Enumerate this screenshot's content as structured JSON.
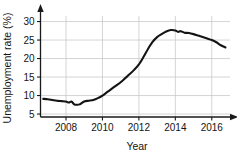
{
  "chart_data": {
    "type": "line",
    "title": "",
    "xlabel": "Year",
    "ylabel": "Unemployment rate (%)",
    "xlim": [
      2006.6,
      2017.0
    ],
    "ylim": [
      4.2,
      31.5
    ],
    "xticks": [
      2008,
      2010,
      2012,
      2014,
      2016
    ],
    "xtick_labels": [
      "2008",
      "2010",
      "2012",
      "2014",
      "2016"
    ],
    "yticks": [
      5,
      10,
      15,
      20,
      25,
      30
    ],
    "ytick_labels": [
      "5",
      "10",
      "15",
      "20",
      "25",
      "30"
    ],
    "grid": true,
    "legend": "none",
    "line_color": "#141414",
    "grid_color": "#c9c9c9",
    "axis_color": "#1a1a1a",
    "series": [
      {
        "name": "Unemployment rate",
        "x": [
          2006.75,
          2007.0,
          2007.25,
          2007.5,
          2007.75,
          2008.0,
          2008.15,
          2008.3,
          2008.45,
          2008.6,
          2008.75,
          2009.0,
          2009.25,
          2009.5,
          2009.75,
          2010.0,
          2010.25,
          2010.5,
          2010.75,
          2011.0,
          2011.25,
          2011.5,
          2011.75,
          2012.0,
          2012.25,
          2012.5,
          2012.75,
          2013.0,
          2013.25,
          2013.5,
          2013.75,
          2014.0,
          2014.15,
          2014.3,
          2014.5,
          2014.75,
          2015.0,
          2015.25,
          2015.5,
          2015.75,
          2016.0,
          2016.25,
          2016.5,
          2016.75
        ],
        "y": [
          9.1,
          9.0,
          8.8,
          8.6,
          8.5,
          8.4,
          8.1,
          8.4,
          7.6,
          7.5,
          7.6,
          8.4,
          8.6,
          8.8,
          9.3,
          10.0,
          10.9,
          11.8,
          12.7,
          13.6,
          14.7,
          15.8,
          17.0,
          18.4,
          20.4,
          22.6,
          24.5,
          25.8,
          26.6,
          27.3,
          27.7,
          27.6,
          27.2,
          27.4,
          27.0,
          26.9,
          26.6,
          26.2,
          25.8,
          25.4,
          25.0,
          24.4,
          23.6,
          23.0
        ]
      }
    ]
  },
  "labels": {
    "x_axis_title": "Year",
    "y_axis_title": "Unemployment rate (%)"
  }
}
